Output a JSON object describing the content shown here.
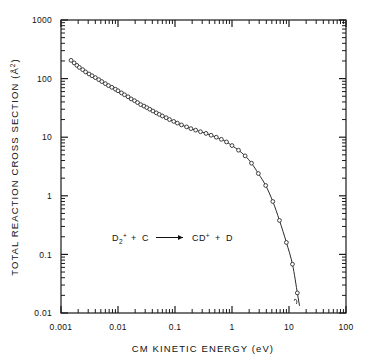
{
  "chart_data": {
    "type": "scatter",
    "title": "",
    "xlabel": "CM KINETIC ENERGY (eV)",
    "ylabel": "TOTAL REACTION CROSS SECTION (Å²)",
    "xscale": "log",
    "yscale": "log",
    "xlim": [
      0.001,
      100
    ],
    "ylim": [
      0.01,
      1000
    ],
    "grid": false,
    "legend": null,
    "xtick_labels": [
      "0.001",
      "0.01",
      "0.1",
      "1",
      "10",
      "100"
    ],
    "xtick_values": [
      0.001,
      0.01,
      0.1,
      1,
      10,
      100
    ],
    "ytick_labels": [
      "1000",
      "100",
      "10",
      "1",
      "0.1",
      "0.01"
    ],
    "ytick_values": [
      1000,
      100,
      10,
      1,
      0.1,
      0.01
    ],
    "minor_ticks": true,
    "annotation": {
      "reaction_reactant_1": "D",
      "reaction_reactant_1_sub": "2",
      "reaction_reactant_1_sup": "+",
      "reaction_plus_1": "+",
      "reaction_reactant_2": "C",
      "reaction_arrow": "⟶",
      "reaction_product_1": "CD",
      "reaction_product_1_sup": "+",
      "reaction_plus_2": "+",
      "reaction_product_2": "D",
      "full_text": "D2+ + C ⟶ CD+ + D"
    },
    "series": [
      {
        "name": "D2+ + C reaction cross section",
        "marker": "open-circle",
        "line": "solid fitted curve",
        "x": [
          0.0015,
          0.0017,
          0.0019,
          0.0021,
          0.0024,
          0.0027,
          0.0031,
          0.0035,
          0.004,
          0.0046,
          0.0052,
          0.006,
          0.0068,
          0.0078,
          0.009,
          0.01,
          0.0115,
          0.013,
          0.015,
          0.017,
          0.0195,
          0.022,
          0.025,
          0.0285,
          0.032,
          0.036,
          0.041,
          0.047,
          0.053,
          0.06,
          0.07,
          0.08,
          0.095,
          0.11,
          0.13,
          0.16,
          0.19,
          0.23,
          0.28,
          0.35,
          0.43,
          0.53,
          0.65,
          0.8,
          1.0,
          1.3,
          1.7,
          2.2,
          2.9,
          3.9,
          5.2,
          6.8,
          9.0,
          11.5,
          14.0
        ],
        "y": [
          205,
          185,
          168,
          155,
          142,
          130,
          120,
          112,
          104,
          96,
          89,
          82,
          76,
          71,
          66,
          62,
          57,
          53,
          49,
          45,
          42,
          39,
          36,
          34,
          32,
          30,
          28,
          26,
          24.5,
          23,
          21.5,
          20,
          18.6,
          17.4,
          16.2,
          15.0,
          14.0,
          13.2,
          12.4,
          11.6,
          10.8,
          10.0,
          9.2,
          8.3,
          7.2,
          6.0,
          4.8,
          3.6,
          2.4,
          1.5,
          0.8,
          0.38,
          0.16,
          0.068,
          0.022
        ]
      }
    ]
  },
  "figure": {
    "background_color": "#ffffff",
    "ink_color": "#1a1a1a",
    "plot_left": 61,
    "plot_right": 346,
    "plot_top": 20,
    "plot_bottom": 313
  }
}
